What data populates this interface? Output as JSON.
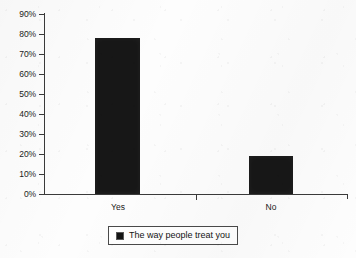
{
  "chart_data": {
    "type": "bar",
    "title": "",
    "subtitle": "",
    "xlabel": "",
    "ylabel": "",
    "categories": [
      "Yes",
      "No"
    ],
    "values": [
      78,
      19
    ],
    "series": [
      {
        "name": "The way people treat you",
        "values": [
          78,
          19
        ],
        "color": "#171717"
      }
    ],
    "ylim": [
      0,
      90
    ],
    "ytick_labels": [
      "90%",
      "80%",
      "70%",
      "60%",
      "50%",
      "40%",
      "30%",
      "20%",
      "10%",
      "0%"
    ],
    "ytick_values": [
      90,
      80,
      70,
      60,
      50,
      40,
      30,
      20,
      10,
      0
    ],
    "grid": false,
    "legend_position": "bottom",
    "legend_entries": [
      "The way people treat you"
    ],
    "annotations": []
  },
  "legend": {
    "swatch_icon": "legend-swatch-icon",
    "label": "The way people treat you",
    "color": "#171717"
  },
  "colors": {
    "bar": "#171717",
    "axis": "#3a3a3a",
    "text": "#1b1b1b",
    "background": "#fdfdfd"
  }
}
